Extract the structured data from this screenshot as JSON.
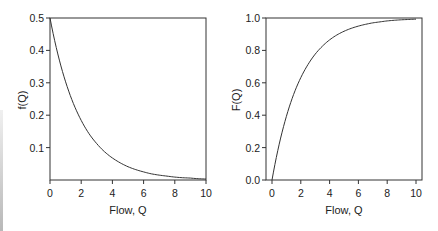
{
  "chart_data": [
    {
      "type": "line",
      "title": "",
      "xlabel": "Flow, Q",
      "ylabel": "f(Q)",
      "xlim": [
        0,
        10
      ],
      "ylim": [
        0,
        0.5
      ],
      "x_ticks": [
        "0",
        "2",
        "4",
        "6",
        "8",
        "10"
      ],
      "y_ticks": [
        "0.1",
        "0.2",
        "0.3",
        "0.4",
        "0.5"
      ],
      "grid": false,
      "legend": null,
      "series": [
        {
          "name": "f(Q) = 0.5·exp(-0.5Q)",
          "x": [
            0,
            0.5,
            1,
            1.5,
            2,
            2.5,
            3,
            3.5,
            4,
            4.5,
            5,
            5.5,
            6,
            6.5,
            7,
            7.5,
            8,
            8.5,
            9,
            9.5,
            10
          ],
          "y": [
            0.5,
            0.389,
            0.303,
            0.236,
            0.184,
            0.143,
            0.112,
            0.087,
            0.068,
            0.053,
            0.041,
            0.032,
            0.025,
            0.019,
            0.015,
            0.012,
            0.009,
            0.007,
            0.006,
            0.004,
            0.003
          ]
        }
      ]
    },
    {
      "type": "line",
      "title": "",
      "xlabel": "Flow, Q",
      "ylabel": "F(Q)",
      "xlim": [
        0,
        10
      ],
      "ylim": [
        0,
        1.0
      ],
      "x_ticks": [
        "0",
        "2",
        "4",
        "6",
        "8",
        "10"
      ],
      "y_ticks": [
        "0.0",
        "0.2",
        "0.4",
        "0.6",
        "0.8",
        "1.0"
      ],
      "grid": false,
      "legend": null,
      "series": [
        {
          "name": "F(Q) = 1 - exp(-0.5Q)",
          "x": [
            0,
            0.5,
            1,
            1.5,
            2,
            2.5,
            3,
            3.5,
            4,
            4.5,
            5,
            5.5,
            6,
            6.5,
            7,
            7.5,
            8,
            8.5,
            9,
            9.5,
            10
          ],
          "y": [
            0.0,
            0.221,
            0.393,
            0.528,
            0.632,
            0.713,
            0.777,
            0.826,
            0.865,
            0.895,
            0.918,
            0.936,
            0.95,
            0.961,
            0.97,
            0.976,
            0.982,
            0.986,
            0.989,
            0.991,
            0.993
          ]
        }
      ]
    }
  ],
  "left_plot": {
    "ylabel": "f(Q)",
    "xlabel": "Flow, Q",
    "x_ticks": [
      "0",
      "2",
      "4",
      "6",
      "8",
      "10"
    ],
    "y_ticks": [
      "0.1",
      "0.2",
      "0.3",
      "0.4",
      "0.5"
    ]
  },
  "right_plot": {
    "ylabel": "F(Q)",
    "xlabel": "Flow, Q",
    "x_ticks": [
      "0",
      "2",
      "4",
      "6",
      "8",
      "10"
    ],
    "y_ticks": [
      "0.0",
      "0.2",
      "0.4",
      "0.6",
      "0.8",
      "1.0"
    ]
  }
}
